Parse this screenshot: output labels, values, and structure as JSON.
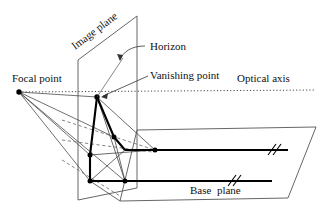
{
  "figure": {
    "background_color": "#ffffff",
    "line_color": "#1a1a1a",
    "thin_line_color": "#444444",
    "dot_color": "#000000",
    "width": 327,
    "height": 213
  },
  "labels": {
    "image_plane": "Image plane",
    "horizon": "Horizon",
    "vanishing_point": "Vanishing point",
    "optical_axis": "Optical axis",
    "focal_point": "Focal point",
    "base_plane": "Base  plane"
  },
  "geometry": {
    "image_plane_polygon": "78,60 137,16 137,188 78,200",
    "base_plane_polygon": "137,130 316,127 288,198 120,201",
    "focal_point": {
      "x": 19,
      "y": 92
    },
    "vanishing_point": {
      "x": 97,
      "y": 97
    },
    "optical_axis": {
      "x1": 19,
      "y1": 92,
      "x2": 316,
      "y2": 90
    },
    "nodes": [
      {
        "name": "vanishing-point-node",
        "x": 97,
        "y": 97
      },
      {
        "name": "image-mid-node",
        "x": 114,
        "y": 137
      },
      {
        "name": "image-lower-node",
        "x": 90,
        "y": 155
      },
      {
        "name": "base-corner-node",
        "x": 90,
        "y": 181
      },
      {
        "name": "base-front-node",
        "x": 125,
        "y": 181
      },
      {
        "name": "base-far-node",
        "x": 155,
        "y": 150
      }
    ],
    "bold_path": "97,97 114,137 125,150 90,155 90,181 125,181",
    "far_line": {
      "x1": 125,
      "y1": 150,
      "x2": 288,
      "y2": 150
    },
    "near_line": {
      "x1": 125,
      "y1": 181,
      "x2": 270,
      "y2": 181
    },
    "break_marks": [
      {
        "name": "break-mark-far",
        "x": 271,
        "y": 150
      },
      {
        "name": "break-mark-near",
        "x": 255,
        "y": 181
      }
    ]
  }
}
